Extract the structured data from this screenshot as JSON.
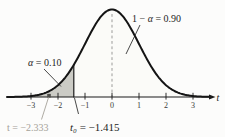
{
  "figure": {
    "alpha_label": {
      "var": "α",
      "value": " = 0.10"
    },
    "confidence_label": {
      "prefix": "1 − ",
      "var": "α",
      "value": " = 0.90"
    },
    "t0_label": {
      "var": "t₀",
      "value": " = −1.415"
    },
    "t_statistic_label": {
      "var": "t",
      "value": " = −2.333"
    },
    "axis_variable": "t"
  },
  "chart_data": {
    "type": "area",
    "xlabel": "t",
    "x_ticks": [
      -3,
      -2,
      -1,
      0,
      1,
      2,
      3
    ],
    "x_range": [
      -3.9,
      3.7
    ],
    "alpha": 0.1,
    "one_minus_alpha": 0.9,
    "critical_value_t0": -1.415,
    "test_statistic_t": -2.333,
    "shaded_region": "left tail where t < −1.415 (area = α = 0.10)",
    "unshaded_region": "area to the right of t₀ = −1.415 (area = 1 − α = 0.90)",
    "center_dashed_line_at": 0,
    "grid": false,
    "legend": false
  },
  "style": {
    "curve_color": "#141414",
    "axis_color": "#1a1a1a",
    "tail_fill": "#cbcbc5",
    "body_fill": "#fbfbf8",
    "dash_color": "#9b9b99",
    "tick_label_color": "#3a3a38",
    "muted_color": "#a5a199",
    "marker_color": "#4e4e4a"
  }
}
